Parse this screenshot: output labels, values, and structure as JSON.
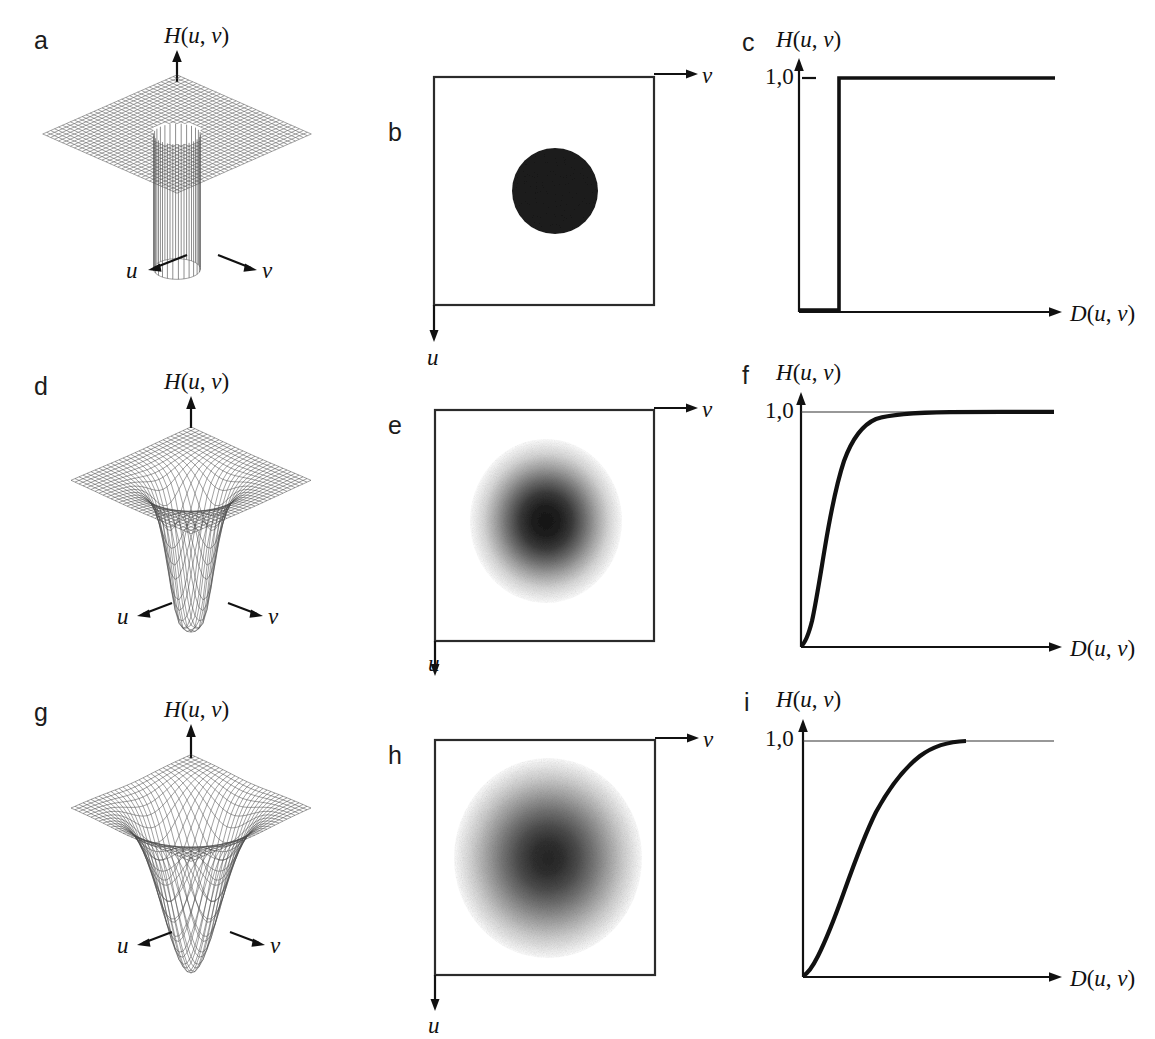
{
  "figure": {
    "kind": "multi-panel-figure",
    "rows": 3,
    "cols": 3,
    "background_color": "#ffffff",
    "ink_color": "#111111"
  },
  "panels": {
    "a": {
      "label": "a",
      "type": "3d-surface-mesh",
      "vertical_axis_label": "H(u, v)",
      "axis_u": "u",
      "axis_v": "v",
      "surface": "ideal-highpass-perspective",
      "note": "flat mesh plane with cylindrical hole at origin"
    },
    "b": {
      "label": "b",
      "type": "image-filter-mask",
      "axis_v": "v",
      "axis_u": "u",
      "mask": "solid-dark-disc",
      "disc_color": "#1b1b1b"
    },
    "c": {
      "label": "c",
      "type": "line",
      "y_axis_label": "H(u, v)",
      "x_axis_label": "D(u, v)",
      "y_tick_label": "1,0"
    },
    "d": {
      "label": "d",
      "type": "3d-surface-mesh",
      "vertical_axis_label": "H(u, v)",
      "axis_u": "u",
      "axis_v": "v",
      "surface": "butterworth-highpass-perspective"
    },
    "e": {
      "label": "e",
      "type": "image-filter-mask",
      "axis_v": "v",
      "axis_u": "u",
      "mask": "soft-dark-blob"
    },
    "f": {
      "label": "f",
      "type": "line",
      "y_axis_label": "H(u, v)",
      "x_axis_label": "D(u, v)",
      "y_tick_label": "1,0"
    },
    "g": {
      "label": "g",
      "type": "3d-surface-mesh",
      "vertical_axis_label": "H(u, v)",
      "axis_u": "u",
      "axis_v": "v",
      "surface": "gaussian-highpass-perspective"
    },
    "h": {
      "label": "h",
      "type": "image-filter-mask",
      "axis_v": "v",
      "axis_u": "u",
      "mask": "broad-soft-dark-blob"
    },
    "i": {
      "label": "i",
      "type": "line",
      "y_axis_label": "H(u, v)",
      "x_axis_label": "D(u, v)",
      "y_tick_label": "1,0"
    }
  },
  "chart_data": [
    {
      "type": "line",
      "panel": "c",
      "title": "Ideal highpass filter transfer function",
      "xlabel": "D(u, v)",
      "ylabel": "H(u, v)",
      "ylim": [
        0,
        1.12
      ],
      "xlim": [
        0,
        1
      ],
      "grid": false,
      "legend": null,
      "annotations": [
        "1,0"
      ],
      "series": [
        {
          "name": "H(u,v) ideal",
          "x": [
            0.0,
            0.15,
            0.15,
            1.0
          ],
          "values": [
            0.0,
            0.0,
            1.0,
            1.0
          ]
        }
      ]
    },
    {
      "type": "line",
      "panel": "f",
      "title": "Butterworth highpass filter transfer function",
      "xlabel": "D(u, v)",
      "ylabel": "H(u, v)",
      "ylim": [
        0,
        1.12
      ],
      "xlim": [
        0,
        1
      ],
      "grid": false,
      "legend": null,
      "annotations": [
        "1,0"
      ],
      "series": [
        {
          "name": "H(u,v) Butterworth n=2",
          "x": [
            0.0,
            0.02,
            0.04,
            0.06,
            0.08,
            0.1,
            0.13,
            0.16,
            0.2,
            0.25,
            0.3,
            0.4,
            0.55,
            0.7,
            0.85,
            1.0
          ],
          "values": [
            0.0,
            0.04,
            0.13,
            0.27,
            0.44,
            0.59,
            0.75,
            0.85,
            0.91,
            0.95,
            0.97,
            0.985,
            0.993,
            0.997,
            0.999,
            1.0
          ]
        }
      ]
    },
    {
      "type": "line",
      "panel": "i",
      "title": "Gaussian highpass filter transfer function",
      "xlabel": "D(u, v)",
      "ylabel": "H(u, v)",
      "ylim": [
        0,
        1.12
      ],
      "xlim": [
        0,
        1
      ],
      "grid": false,
      "legend": null,
      "annotations": [
        "1,0"
      ],
      "series": [
        {
          "name": "H(u,v) Gaussian",
          "x": [
            0.0,
            0.03,
            0.07,
            0.11,
            0.15,
            0.19,
            0.24,
            0.29,
            0.35,
            0.41,
            0.48,
            0.55,
            0.62,
            0.7,
            0.78
          ],
          "values": [
            0.0,
            0.04,
            0.14,
            0.27,
            0.41,
            0.54,
            0.67,
            0.77,
            0.86,
            0.92,
            0.96,
            0.98,
            0.995,
            1.0,
            1.0
          ]
        }
      ]
    }
  ]
}
